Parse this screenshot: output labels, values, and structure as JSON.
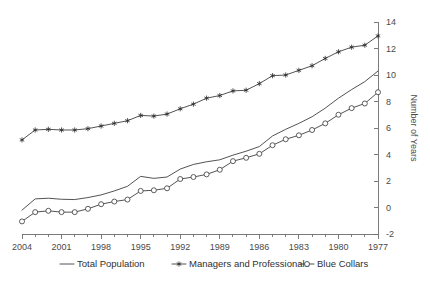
{
  "chart_data": {
    "type": "line",
    "title": "",
    "subtitle": "",
    "xlabel": "",
    "ylabel": "Number of Years",
    "ylim": [
      -2,
      14
    ],
    "ytick_step": 2,
    "yticks": [
      -2,
      0,
      2,
      4,
      6,
      8,
      10,
      12,
      14
    ],
    "yaxis_position": "right",
    "grid": false,
    "legend_position": "below",
    "x_order": "descending",
    "x": [
      2004,
      2003,
      2002,
      2001,
      2000,
      1999,
      1998,
      1997,
      1996,
      1995,
      1994,
      1993,
      1992,
      1991,
      1990,
      1989,
      1988,
      1987,
      1986,
      1985,
      1984,
      1983,
      1982,
      1981,
      1980,
      1979,
      1978,
      1977
    ],
    "xtick_labels": [
      "2004",
      "2001",
      "1998",
      "1995",
      "1992",
      "1989",
      "1986",
      "1983",
      "1980",
      "1977"
    ],
    "xtick_values": [
      2004,
      2001,
      1998,
      1995,
      1992,
      1989,
      1986,
      1983,
      1980,
      1977
    ],
    "series": [
      {
        "name": "Total Population",
        "marker": "none",
        "color": "#404040",
        "values": [
          -0.2,
          0.65,
          0.7,
          0.62,
          0.6,
          0.75,
          0.95,
          1.25,
          1.6,
          2.35,
          2.2,
          2.3,
          2.9,
          3.25,
          3.45,
          3.6,
          3.95,
          4.25,
          4.6,
          5.4,
          5.9,
          6.35,
          6.85,
          7.5,
          8.25,
          8.9,
          9.5,
          10.3
        ]
      },
      {
        "name": "Managers and Professionals",
        "marker": "star",
        "color": "#2a2a2a",
        "values": [
          5.1,
          5.85,
          5.9,
          5.85,
          5.85,
          5.95,
          6.15,
          6.35,
          6.55,
          6.95,
          6.9,
          7.05,
          7.45,
          7.8,
          8.25,
          8.45,
          8.8,
          8.85,
          9.35,
          9.95,
          10.0,
          10.35,
          10.7,
          11.25,
          11.75,
          12.1,
          12.25,
          12.95
        ]
      },
      {
        "name": "Blue Collars",
        "marker": "open-circle",
        "color": "#404040",
        "values": [
          -1.05,
          -0.35,
          -0.25,
          -0.35,
          -0.35,
          -0.1,
          0.25,
          0.45,
          0.6,
          1.25,
          1.3,
          1.45,
          2.15,
          2.3,
          2.5,
          2.85,
          3.5,
          3.75,
          4.05,
          4.7,
          5.15,
          5.45,
          5.85,
          6.35,
          7.0,
          7.5,
          7.85,
          8.7
        ]
      }
    ]
  },
  "legend": {
    "items": [
      {
        "label": "Total Population",
        "marker": "none"
      },
      {
        "label": "Managers and Professionals",
        "marker": "star"
      },
      {
        "label": "Blue Collars",
        "marker": "open-circle"
      }
    ]
  }
}
